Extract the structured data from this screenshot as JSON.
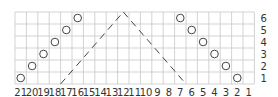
{
  "chart": {
    "type": "knitting-chart",
    "columns": 21,
    "rows": 6,
    "column_labels": [
      "21",
      "20",
      "19",
      "18",
      "17",
      "16",
      "15",
      "14",
      "13",
      "12",
      "11",
      "10",
      "9",
      "8",
      "7",
      "6",
      "5",
      "4",
      "3",
      "2",
      "1"
    ],
    "row_labels": [
      "1",
      "2",
      "3",
      "4",
      "5",
      "6"
    ],
    "symbols": {
      "yarn_over": [
        {
          "row": 1,
          "col": 21
        },
        {
          "row": 2,
          "col": 20
        },
        {
          "row": 3,
          "col": 19
        },
        {
          "row": 4,
          "col": 18
        },
        {
          "row": 5,
          "col": 17
        },
        {
          "row": 6,
          "col": 16
        },
        {
          "row": 6,
          "col": 7
        },
        {
          "row": 5,
          "col": 6
        },
        {
          "row": 4,
          "col": 5
        },
        {
          "row": 3,
          "col": 4
        },
        {
          "row": 2,
          "col": 3
        },
        {
          "row": 1,
          "col": 2
        }
      ],
      "dashed_lines": [
        {
          "from": {
            "col_edge": 17,
            "row_edge": 0
          },
          "to": {
            "col_edge": 11.5,
            "row_edge": 6
          }
        },
        {
          "from": {
            "col_edge": 11.5,
            "row_edge": 6
          },
          "to": {
            "col_edge": 6,
            "row_edge": 0
          }
        }
      ]
    },
    "colors": {
      "grid": "#c8c8c8",
      "symbol": "#444444",
      "label": "#333333"
    }
  }
}
